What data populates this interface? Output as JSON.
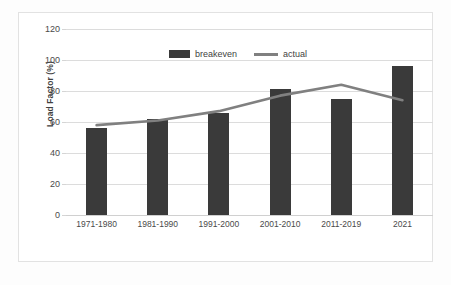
{
  "chart_data": {
    "type": "bar",
    "title": "",
    "xlabel": "",
    "ylabel": "Load Factor (%)",
    "ylim": [
      0,
      120
    ],
    "yticks": [
      0,
      20,
      40,
      60,
      80,
      100,
      120
    ],
    "grid": true,
    "legend_position": "top-center",
    "categories": [
      "1971-1980",
      "1981-1990",
      "1991-2000",
      "2001-2010",
      "2011-2019",
      "2021"
    ],
    "series": [
      {
        "name": "breakeven",
        "type": "bar",
        "color": "#3a3a3a",
        "values": [
          56,
          62,
          66,
          81,
          75,
          96
        ]
      },
      {
        "name": "actual",
        "type": "line",
        "color": "#808080",
        "values": [
          58,
          61,
          67,
          77,
          84,
          74
        ]
      }
    ]
  },
  "axis": {
    "y_title": "Load Factor (%)",
    "y_tick_labels": [
      "120",
      "100",
      "80",
      "60",
      "40",
      "20",
      "0"
    ],
    "x_tick_labels": [
      "1971-1980",
      "1981-1990",
      "1991-2000",
      "2001-2010",
      "2011-2019",
      "2021"
    ]
  },
  "legend": {
    "items": [
      {
        "label": "breakeven",
        "marker": "bar-swatch",
        "color": "#3a3a3a"
      },
      {
        "label": "actual",
        "marker": "line-swatch",
        "color": "#808080"
      }
    ]
  },
  "colors": {
    "bar": "#3a3a3a",
    "line": "#808080",
    "gridline": "#dcdcdc",
    "frame": "#e2e2e2",
    "background": "#ffffff",
    "text": "#3f3f3f"
  }
}
